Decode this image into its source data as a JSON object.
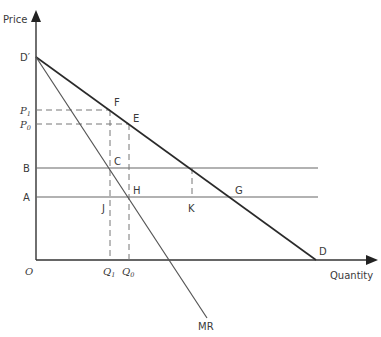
{
  "diagram": {
    "type": "monopoly-demand-mr",
    "axes": {
      "y_label": "Price",
      "x_label": "Quantity",
      "origin_label": "O"
    },
    "curves": {
      "demand": {
        "start_label": "D′",
        "end_label": "D"
      },
      "marginal_revenue": {
        "label": "MR"
      }
    },
    "price_levels": [
      {
        "label": "P",
        "sub": "1"
      },
      {
        "label": "P",
        "sub": "0"
      },
      {
        "label": "B",
        "sub": ""
      },
      {
        "label": "A",
        "sub": ""
      }
    ],
    "quantity_levels": [
      {
        "label": "Q",
        "sub": "1"
      },
      {
        "label": "Q",
        "sub": "0"
      }
    ],
    "points": [
      "F",
      "E",
      "C",
      "H",
      "J",
      "K",
      "G"
    ]
  },
  "colors": {
    "axis": "#333333",
    "demand": "#2a2a2a",
    "mr": "#555555",
    "horizontal": "#666666",
    "dashed": "#777777"
  }
}
